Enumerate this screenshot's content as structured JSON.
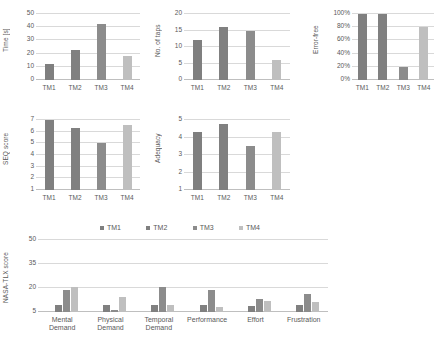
{
  "palette": {
    "tm1": "#7f7f7f",
    "tm2": "#808080",
    "tm3": "#8c8c8c",
    "tm4": "#bfbfbf",
    "grid": "#d9d9d9",
    "text": "#595959",
    "background": "#ffffff"
  },
  "series_names": [
    "TM1",
    "TM2",
    "TM3",
    "TM4"
  ],
  "legend": {
    "items": [
      {
        "label": "TM1",
        "color": "#7f7f7f"
      },
      {
        "label": "TM2",
        "color": "#808080"
      },
      {
        "label": "TM3",
        "color": "#8c8c8c"
      },
      {
        "label": "TM4",
        "color": "#bfbfbf"
      }
    ]
  },
  "chart_data": [
    {
      "id": "time",
      "type": "bar",
      "title": "",
      "xlabel": "",
      "ylabel": "Time [s]",
      "categories": [
        "TM1",
        "TM2",
        "TM3",
        "TM4"
      ],
      "values": [
        12,
        22.5,
        42.5,
        18.5
      ],
      "ylim": [
        0,
        50
      ],
      "yticks": [
        0,
        10,
        20,
        30,
        40,
        50
      ],
      "ytick_labels": [
        "0",
        "10",
        "20",
        "30",
        "40",
        "50"
      ],
      "grid": true,
      "legend_position": "none"
    },
    {
      "id": "taps",
      "type": "bar",
      "title": "",
      "xlabel": "",
      "ylabel": "No. of taps",
      "categories": [
        "TM1",
        "TM2",
        "TM3",
        "TM4"
      ],
      "values": [
        12,
        16,
        15,
        6
      ],
      "ylim": [
        0,
        20
      ],
      "yticks": [
        0,
        5,
        10,
        15,
        20
      ],
      "ytick_labels": [
        "0",
        "5",
        "10",
        "15",
        "20"
      ],
      "grid": true,
      "legend_position": "none"
    },
    {
      "id": "errorfree",
      "type": "bar",
      "title": "",
      "xlabel": "",
      "ylabel": "Error-free",
      "categories": [
        "TM1",
        "TM2",
        "TM3",
        "TM4"
      ],
      "values": [
        100,
        100,
        20,
        80
      ],
      "ylim": [
        0,
        100
      ],
      "yticks": [
        0,
        20,
        40,
        60,
        80,
        100
      ],
      "ytick_labels": [
        "0%",
        "20%",
        "40%",
        "60%",
        "80%",
        "100%"
      ],
      "grid": true,
      "legend_position": "none"
    },
    {
      "id": "seq",
      "type": "bar",
      "title": "",
      "xlabel": "",
      "ylabel": "SEQ score",
      "categories": [
        "TM1",
        "TM2",
        "TM3",
        "TM4"
      ],
      "values": [
        7.0,
        6.35,
        5.0,
        6.6
      ],
      "ylim": [
        1,
        7
      ],
      "yticks": [
        1,
        2,
        3,
        4,
        5,
        6,
        7
      ],
      "ytick_labels": [
        "1",
        "2",
        "3",
        "4",
        "5",
        "6",
        "7"
      ],
      "grid": true,
      "legend_position": "none"
    },
    {
      "id": "adequacy",
      "type": "bar",
      "title": "",
      "xlabel": "",
      "ylabel": "Adequacy",
      "categories": [
        "TM1",
        "TM2",
        "TM3",
        "TM4"
      ],
      "values": [
        4.3,
        4.8,
        3.5,
        4.3
      ],
      "ylim": [
        1,
        5
      ],
      "yticks": [
        1,
        2,
        3,
        4,
        5
      ],
      "ytick_labels": [
        "1",
        "2",
        "3",
        "4",
        "5"
      ],
      "grid": true,
      "legend_position": "none"
    },
    {
      "id": "nasatlx",
      "type": "bar",
      "title": "",
      "xlabel": "",
      "ylabel": "NASA-TLX score",
      "categories": [
        "Mental Demand",
        "Physical Demand",
        "Temporal Demand",
        "Performance",
        "Effort",
        "Frustration"
      ],
      "category_lines": [
        [
          "Mental",
          "Demand"
        ],
        [
          "Physical",
          "Demand"
        ],
        [
          "Temporal",
          "Demand"
        ],
        [
          "Performance"
        ],
        [
          "Effort"
        ],
        [
          "Frustration"
        ]
      ],
      "series": [
        {
          "name": "TM1",
          "values": [
            5,
            5,
            5,
            5,
            5,
            5
          ]
        },
        {
          "name": "TM2",
          "values": [
            9.5,
            9.3,
            9.3,
            9.5,
            9.0,
            9.5
          ]
        },
        {
          "name": "TM3",
          "values": [
            18.5,
            6.0,
            20.5,
            19.0,
            13.0,
            16.5
          ]
        },
        {
          "name": "TM4",
          "values": [
            20.5,
            14.5,
            9.5,
            8.0,
            12.0,
            11.0
          ]
        }
      ],
      "ylim": [
        5,
        50
      ],
      "yticks": [
        5,
        20,
        35,
        50
      ],
      "ytick_labels": [
        "5",
        "20",
        "35",
        "50"
      ],
      "grid": true,
      "legend_position": "top"
    }
  ]
}
